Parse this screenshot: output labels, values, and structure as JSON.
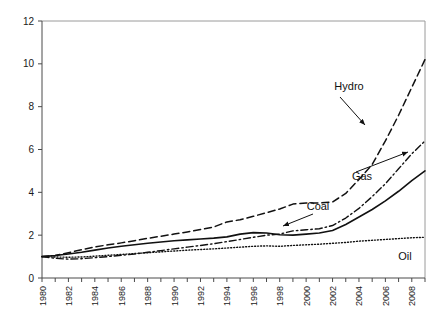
{
  "chart_data": {
    "type": "line",
    "title": "",
    "subtitle": "",
    "xlabel": "",
    "ylabel": "",
    "xlim": [
      1980,
      2009
    ],
    "ylim": [
      0,
      12
    ],
    "grid": false,
    "legend_position": "inline-annotations",
    "y_ticks": [
      0,
      2,
      4,
      6,
      8,
      10,
      12
    ],
    "x_ticks": [
      1980,
      1981,
      1982,
      1983,
      1984,
      1985,
      1986,
      1987,
      1988,
      1989,
      1990,
      1991,
      1992,
      1993,
      1994,
      1995,
      1996,
      1997,
      1998,
      1999,
      2000,
      2001,
      2002,
      2003,
      2004,
      2005,
      2006,
      2007,
      2008,
      2009
    ],
    "x_tick_labels": [
      "1980",
      "",
      "1982",
      "",
      "1984",
      "",
      "1986",
      "",
      "1988",
      "",
      "1990",
      "",
      "1992",
      "",
      "1994",
      "",
      "1996",
      "",
      "1998",
      "",
      "2000",
      "",
      "2002",
      "",
      "2004",
      "",
      "2006",
      "",
      "2008",
      ""
    ],
    "x": [
      1980,
      1981,
      1982,
      1983,
      1984,
      1985,
      1986,
      1987,
      1988,
      1989,
      1990,
      1991,
      1992,
      1993,
      1994,
      1995,
      1996,
      1997,
      1998,
      1999,
      2000,
      2001,
      2002,
      2003,
      2004,
      2005,
      2006,
      2007,
      2008,
      2009
    ],
    "series": [
      {
        "name": "Hydro",
        "style": "dashed",
        "color": "#111111",
        "values": [
          1.0,
          1.05,
          1.18,
          1.32,
          1.45,
          1.55,
          1.64,
          1.74,
          1.85,
          1.95,
          2.05,
          2.15,
          2.26,
          2.38,
          2.62,
          2.72,
          2.88,
          3.05,
          3.22,
          3.45,
          3.5,
          3.5,
          3.55,
          3.95,
          4.6,
          5.3,
          6.4,
          7.6,
          8.9,
          10.2
        ]
      },
      {
        "name": "Gas",
        "style": "dash-dot",
        "color": "#111111",
        "values": [
          1.0,
          0.92,
          0.88,
          0.9,
          0.95,
          1.0,
          1.06,
          1.12,
          1.2,
          1.28,
          1.36,
          1.44,
          1.52,
          1.6,
          1.7,
          1.8,
          1.9,
          2.0,
          2.05,
          2.2,
          2.25,
          2.3,
          2.45,
          2.8,
          3.25,
          3.8,
          4.4,
          5.1,
          5.8,
          6.4
        ]
      },
      {
        "name": "Coal",
        "style": "solid",
        "color": "#111111",
        "values": [
          1.0,
          1.05,
          1.12,
          1.2,
          1.3,
          1.4,
          1.48,
          1.55,
          1.62,
          1.68,
          1.74,
          1.78,
          1.82,
          1.86,
          1.92,
          2.05,
          2.12,
          2.1,
          2.02,
          2.0,
          2.05,
          2.1,
          2.22,
          2.5,
          2.85,
          3.2,
          3.6,
          4.05,
          4.55,
          5.0
        ]
      },
      {
        "name": "Oil",
        "style": "dotted",
        "color": "#111111",
        "values": [
          1.0,
          0.98,
          0.97,
          0.98,
          1.02,
          1.06,
          1.1,
          1.14,
          1.18,
          1.22,
          1.26,
          1.3,
          1.33,
          1.36,
          1.4,
          1.44,
          1.48,
          1.5,
          1.48,
          1.52,
          1.55,
          1.58,
          1.62,
          1.66,
          1.72,
          1.76,
          1.8,
          1.84,
          1.88,
          1.9
        ]
      }
    ],
    "annotations": [
      {
        "text": "Hydro",
        "label_x": 349,
        "label_y": 90,
        "arrow_from": [
          340,
          97
        ],
        "arrow_to": [
          365,
          125
        ]
      },
      {
        "text": "Gas",
        "label_x": 362,
        "label_y": 180,
        "arrow_from": [
          356,
          172
        ],
        "arrow_to": [
          408,
          152
        ]
      },
      {
        "text": "Coal",
        "label_x": 318,
        "label_y": 210,
        "arrow_from": [
          313,
          214
        ],
        "arrow_to": [
          283,
          226
        ]
      },
      {
        "text": "Oil",
        "label_x": 405,
        "label_y": 260,
        "arrow_from": null,
        "arrow_to": null
      }
    ]
  }
}
